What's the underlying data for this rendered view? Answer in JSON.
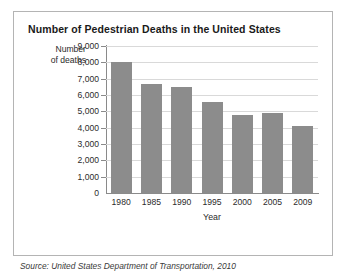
{
  "figure": {
    "title": "Number of Pedestrian Deaths in the United States",
    "y_axis_title_line1": "Number",
    "y_axis_title_line2": "of deaths",
    "x_axis_title": "Year",
    "source_note": "Source: United States Department of Transportation, 2010",
    "bar_color": "#8c8c8c",
    "gridline_color": "#d9d9d9",
    "axis_color": "#8a8a8a",
    "frame_color": "#b4b4b4"
  },
  "chart_data": {
    "type": "bar",
    "title": "Number of Pedestrian Deaths in the United States",
    "xlabel": "Year",
    "ylabel": "Number of deaths",
    "categories": [
      "1980",
      "1985",
      "1990",
      "1995",
      "2000",
      "2005",
      "2009"
    ],
    "values": [
      8000,
      6700,
      6500,
      5600,
      4750,
      4900,
      4100
    ],
    "ylim": [
      0,
      9000
    ],
    "ytick_labels": [
      "0",
      "1,000",
      "2,000",
      "3,000",
      "4,000",
      "5,000",
      "6,000",
      "7,000",
      "8,000",
      "9,000"
    ],
    "ytick_values": [
      0,
      1000,
      2000,
      3000,
      4000,
      5000,
      6000,
      7000,
      8000,
      9000
    ],
    "grid": "horizontal",
    "legend": "none",
    "series": [
      {
        "name": "Pedestrian deaths",
        "values": [
          8000,
          6700,
          6500,
          5600,
          4750,
          4900,
          4100
        ]
      }
    ]
  }
}
